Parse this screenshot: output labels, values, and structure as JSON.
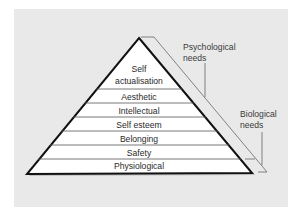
{
  "diagram": {
    "type": "pyramid",
    "title": "",
    "levels": [
      {
        "label_line1": "Self",
        "label_line2": "actualisation"
      },
      {
        "label": "Aesthetic"
      },
      {
        "label": "Intellectual"
      },
      {
        "label": "Self esteem"
      },
      {
        "label": "Belonging"
      },
      {
        "label": "Safety"
      },
      {
        "label": "Physiological"
      }
    ],
    "brackets": [
      {
        "label_line1": "Psychological",
        "label_line2": "needs"
      },
      {
        "label_line1": "Biological",
        "label_line2": "needs"
      }
    ],
    "colors": {
      "background": "#e9e9e9",
      "pyramid_fill": "#ffffff",
      "outline": "#111111"
    }
  }
}
